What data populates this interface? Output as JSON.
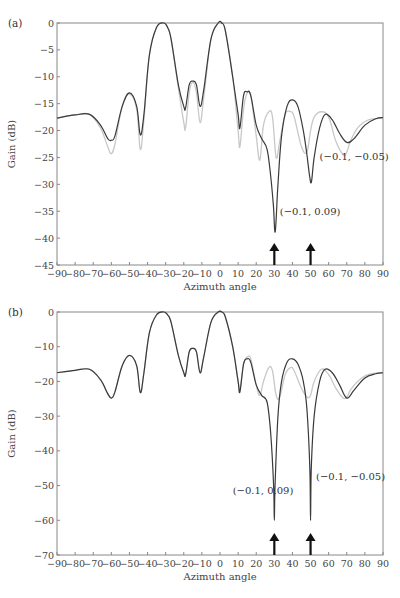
{
  "chart_data": [
    {
      "type": "line",
      "panel_label": "(a)",
      "xlabel": "Azimuth angle",
      "ylabel": "Gain (dB)",
      "xlim": [
        -90,
        90
      ],
      "ylim": [
        -45,
        0
      ],
      "xticks": [
        -90,
        -80,
        -70,
        -60,
        -50,
        -40,
        -30,
        -20,
        -10,
        0,
        10,
        20,
        30,
        40,
        50,
        60,
        70,
        80,
        90
      ],
      "xtick_labels": [
        "−90",
        "−80",
        "−70",
        "−60",
        "−50",
        "−40",
        "−30",
        "−20",
        "−10",
        "0",
        "10",
        "20",
        "30",
        "40",
        "50",
        "60",
        "70",
        "80",
        "90"
      ],
      "yticks": [
        0,
        -5,
        -10,
        -15,
        -20,
        -25,
        -30,
        -35,
        -40,
        -45
      ],
      "ytick_labels": [
        "0",
        "−5",
        "−10",
        "−15",
        "−20",
        "−25",
        "−30",
        "−35",
        "−40",
        "−45"
      ],
      "grid": false,
      "series": [
        {
          "name": "original pattern",
          "color": "#c8c8c8",
          "x": [
            -90,
            -80,
            -72,
            -66,
            -62,
            -60,
            -58,
            -54,
            -50,
            -46,
            -44,
            -42,
            -39,
            -35,
            -31,
            -29,
            -27,
            -23,
            -20,
            -19,
            -17,
            -15,
            -13,
            -11,
            -9,
            -5,
            -1,
            1,
            3,
            7,
            10,
            11,
            13,
            15,
            17,
            20,
            22,
            24,
            27,
            29,
            31,
            33,
            36,
            39,
            41,
            45,
            48,
            50,
            52,
            56,
            60,
            64,
            68,
            70,
            72,
            76,
            82,
            90
          ],
          "y": [
            -17.7,
            -17.1,
            -17.0,
            -19.5,
            -23.0,
            -24.3,
            -22.5,
            -15.5,
            -13.2,
            -16.0,
            -23.5,
            -18.0,
            -6.0,
            -0.8,
            0,
            -0.8,
            -3.0,
            -12.0,
            -18.5,
            -19.5,
            -13.0,
            -11.0,
            -13.0,
            -18.5,
            -14.0,
            -3.0,
            0,
            0,
            -1.5,
            -10.0,
            -20.0,
            -23.0,
            -16.0,
            -13.0,
            -13.5,
            -21.0,
            -25.5,
            -19.0,
            -16.5,
            -17.5,
            -25.0,
            -22.0,
            -17.0,
            -16.5,
            -17.5,
            -23.0,
            -24.0,
            -20.0,
            -17.5,
            -16.5,
            -17.5,
            -22.0,
            -24.5,
            -24.0,
            -22.0,
            -19.5,
            -18.0,
            -17.7
          ]
        },
        {
          "name": "modified pattern",
          "color": "#3a3a3a",
          "x": [
            -90,
            -80,
            -72,
            -66,
            -62,
            -60,
            -58,
            -54,
            -50,
            -46,
            -44,
            -42,
            -39,
            -35,
            -31,
            -29,
            -27,
            -23,
            -20,
            -19,
            -17,
            -15,
            -13,
            -11,
            -9,
            -5,
            -1,
            1,
            3,
            7,
            10,
            11,
            13,
            15,
            17,
            20,
            23,
            26,
            28,
            29.5,
            30.5,
            32,
            34,
            37,
            40,
            43,
            46,
            48,
            49.5,
            50.5,
            52,
            55,
            58,
            62,
            66,
            70,
            74,
            80,
            86,
            90
          ],
          "y": [
            -17.7,
            -17.1,
            -17.0,
            -19.0,
            -21.5,
            -21.8,
            -21.0,
            -15.5,
            -13.0,
            -15.5,
            -20.8,
            -17.0,
            -6.0,
            -0.8,
            0,
            -0.8,
            -3.0,
            -11.5,
            -15.5,
            -15.8,
            -11.5,
            -10.8,
            -11.5,
            -15.5,
            -12.5,
            -3.0,
            0,
            0,
            -1.5,
            -10.0,
            -17.0,
            -19.5,
            -13.5,
            -12.8,
            -13.5,
            -19.0,
            -21.5,
            -23.5,
            -28.5,
            -34.0,
            -38.8,
            -30.0,
            -21.0,
            -15.5,
            -14.3,
            -15.5,
            -20.0,
            -24.5,
            -28.5,
            -29.5,
            -25.0,
            -19.5,
            -17.0,
            -18.0,
            -20.5,
            -22.2,
            -21.5,
            -19.0,
            -17.8,
            -17.6
          ]
        }
      ],
      "annotations": [
        {
          "text": "(−0.1, 0.09)",
          "x": 33,
          "y": -35.7
        },
        {
          "text": "(−0.1, −0.05)",
          "x": 55,
          "y": -25.5
        }
      ],
      "arrows": [
        {
          "x": 30
        },
        {
          "x": 50
        }
      ]
    },
    {
      "type": "line",
      "panel_label": "(b)",
      "xlabel": "Azimuth angle",
      "ylabel": "Gain (dB)",
      "xlim": [
        -90,
        90
      ],
      "ylim": [
        -70,
        0
      ],
      "xticks": [
        -90,
        -80,
        -70,
        -60,
        -50,
        -40,
        -30,
        -20,
        -10,
        0,
        10,
        20,
        30,
        40,
        50,
        60,
        70,
        80,
        90
      ],
      "xtick_labels": [
        "−90",
        "−80",
        "−70",
        "−60",
        "−50",
        "−40",
        "−30",
        "−20",
        "−10",
        "0",
        "10",
        "20",
        "30",
        "40",
        "50",
        "60",
        "70",
        "80",
        "90"
      ],
      "yticks": [
        0,
        -10,
        -20,
        -30,
        -40,
        -50,
        -60,
        -70
      ],
      "ytick_labels": [
        "0",
        "−10",
        "−20",
        "−30",
        "−40",
        "−50",
        "−60",
        "−70"
      ],
      "grid": false,
      "series": [
        {
          "name": "original pattern",
          "color": "#c8c8c8",
          "x": [
            -90,
            -80,
            -72,
            -66,
            -62,
            -60,
            -58,
            -54,
            -50,
            -46,
            -44,
            -42,
            -39,
            -35,
            -31,
            -29,
            -27,
            -23,
            -20,
            -19,
            -17,
            -15,
            -13,
            -11,
            -9,
            -5,
            -1,
            1,
            3,
            7,
            10,
            11,
            13,
            15,
            17,
            20,
            22,
            24,
            27,
            29,
            31,
            33,
            36,
            39,
            41,
            45,
            48,
            50,
            52,
            56,
            60,
            64,
            68,
            70,
            72,
            76,
            82,
            90
          ],
          "y": [
            -17.5,
            -16.8,
            -16.5,
            -19.5,
            -23.5,
            -24.8,
            -23.0,
            -15.5,
            -12.5,
            -15.5,
            -23.2,
            -17.5,
            -6.0,
            -0.8,
            0,
            -0.8,
            -3.0,
            -12.5,
            -17.5,
            -18.0,
            -11.5,
            -10.5,
            -11.5,
            -17.5,
            -13.0,
            -3.0,
            0,
            0,
            -1.5,
            -10.0,
            -20.0,
            -22.5,
            -15.0,
            -13.0,
            -13.5,
            -21.0,
            -24.0,
            -20.0,
            -16.0,
            -17.0,
            -24.0,
            -24.5,
            -18.0,
            -16.0,
            -17.0,
            -22.0,
            -24.5,
            -24.0,
            -20.0,
            -16.5,
            -18.0,
            -22.0,
            -24.8,
            -24.5,
            -22.5,
            -20.0,
            -18.0,
            -17.5
          ]
        },
        {
          "name": "modified pattern",
          "color": "#3a3a3a",
          "x": [
            -90,
            -80,
            -72,
            -66,
            -62,
            -60,
            -58,
            -54,
            -50,
            -46,
            -44,
            -42,
            -39,
            -35,
            -31,
            -29,
            -27,
            -23,
            -20,
            -19,
            -17,
            -15,
            -13,
            -11,
            -9,
            -5,
            -1,
            1,
            3,
            7,
            10,
            11,
            13,
            15,
            17,
            20,
            23,
            26,
            28,
            29.6,
            30,
            30.4,
            32,
            34,
            37,
            40,
            43,
            46,
            48,
            49.6,
            50,
            50.4,
            52,
            55,
            58,
            62,
            66,
            70,
            74,
            80,
            86,
            90
          ],
          "y": [
            -17.5,
            -16.8,
            -16.5,
            -19.5,
            -23.5,
            -24.8,
            -23.0,
            -15.5,
            -12.5,
            -15.5,
            -23.2,
            -17.5,
            -6.0,
            -0.8,
            0,
            -0.8,
            -3.0,
            -12.5,
            -17.5,
            -18.0,
            -11.5,
            -10.5,
            -11.5,
            -17.5,
            -13.0,
            -3.0,
            0,
            0,
            -1.5,
            -10.0,
            -20.0,
            -23.0,
            -15.0,
            -13.5,
            -14.5,
            -21.0,
            -24.0,
            -26.0,
            -35.0,
            -50.0,
            -60.0,
            -50.0,
            -30.0,
            -20.0,
            -14.5,
            -13.5,
            -15.0,
            -20.0,
            -28.0,
            -45.0,
            -60.0,
            -45.0,
            -30.0,
            -20.0,
            -16.5,
            -17.5,
            -21.0,
            -24.8,
            -22.5,
            -19.0,
            -17.8,
            -17.5
          ]
        }
      ],
      "annotations": [
        {
          "text": "(−0.1, 0.09)",
          "x": 7,
          "y": -52.5
        },
        {
          "text": "(−0.1, −0.05)",
          "x": 53,
          "y": -48.5
        }
      ],
      "arrows": [
        {
          "x": 30
        },
        {
          "x": 50
        }
      ]
    }
  ]
}
